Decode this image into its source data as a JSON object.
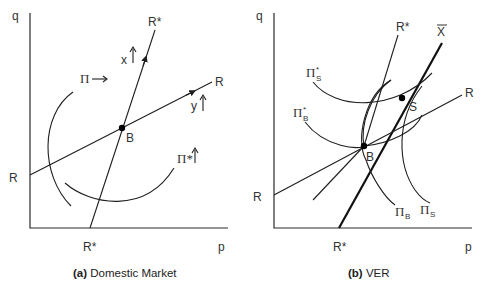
{
  "panel_a": {
    "caption_prefix": "(a)",
    "caption_text": " Domestic Market",
    "axis_y_label": "q",
    "axis_x_label": "p",
    "line_rstar_top": "R*",
    "line_rstar_bottom": "R*",
    "line_r_left": "R",
    "line_r_right": "R",
    "point_b": "B",
    "arrow_x_label": "x",
    "arrow_y_label": "y",
    "pi_label": "Π",
    "pi_arrow": "⟶",
    "pistar_label": "Π*"
  },
  "panel_b": {
    "caption_prefix": "(b)",
    "caption_text": " VER",
    "axis_y_label": "q",
    "axis_x_label": "p",
    "line_rstar_top": "R*",
    "line_rstar_bottom": "R*",
    "line_r_left": "R",
    "line_r_right": "R",
    "line_xbar": "X",
    "point_b": "B",
    "point_s": "S",
    "pi_s_star": "Π",
    "pi_s_star_sub": "S",
    "pi_b_star": "Π",
    "pi_b_star_sub": "B",
    "pi_b": "Π",
    "pi_b_sub": "B",
    "pi_s": "Π",
    "pi_s_sub": "S",
    "star": "*"
  }
}
